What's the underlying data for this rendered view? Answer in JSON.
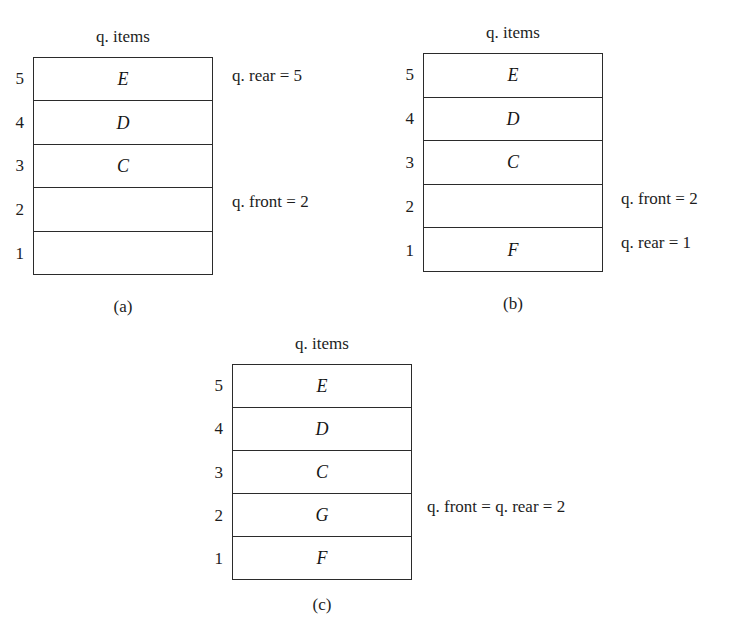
{
  "page": {
    "background_color": "#ffffff",
    "ink_color": "#1d1d1d"
  },
  "figures": [
    {
      "id": "a",
      "caption": "(a)",
      "title": "q. items",
      "indices": [
        "5",
        "4",
        "3",
        "2",
        "1"
      ],
      "cells": [
        "E",
        "D",
        "C",
        "",
        ""
      ],
      "annotations": [
        {
          "text": "q. rear = 5",
          "row": 5
        },
        {
          "text": "q. front = 2",
          "row": 2
        }
      ]
    },
    {
      "id": "b",
      "caption": "(b)",
      "title": "q. items",
      "indices": [
        "5",
        "4",
        "3",
        "2",
        "1"
      ],
      "cells": [
        "E",
        "D",
        "C",
        "",
        "F"
      ],
      "annotations": [
        {
          "text": "q. front = 2",
          "row": 2
        },
        {
          "text": "q. rear = 1",
          "row": 1
        }
      ]
    },
    {
      "id": "c",
      "caption": "(c)",
      "title": "q. items",
      "indices": [
        "5",
        "4",
        "3",
        "2",
        "1"
      ],
      "cells": [
        "E",
        "D",
        "C",
        "G",
        "F"
      ],
      "annotations": [
        {
          "text": "q. front = q. rear = 2",
          "row": 2
        }
      ]
    }
  ]
}
